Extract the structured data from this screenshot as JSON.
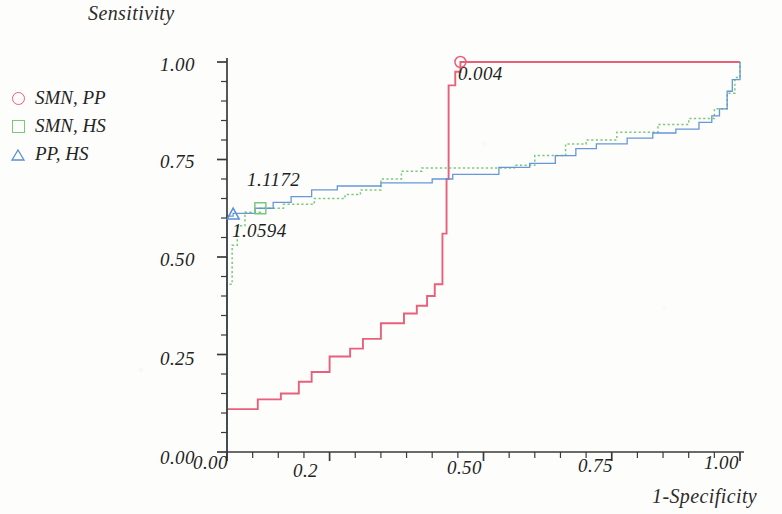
{
  "chart_data": {
    "type": "line",
    "title": "",
    "ylabel": "Sensitivity",
    "xlabel": "1-Specificity",
    "xlim": [
      0,
      1
    ],
    "ylim": [
      0,
      1
    ],
    "grid": false,
    "legend_position": "left",
    "x_ticks": [
      "0.00",
      "0.2",
      "0.50",
      "0.75",
      "1.00"
    ],
    "x_tick_values": [
      0,
      0.2,
      0.5,
      0.75,
      1.0
    ],
    "y_ticks": [
      "0.00",
      "0.25",
      "0.50",
      "0.75",
      "1.00"
    ],
    "y_tick_values": [
      0,
      0.25,
      0.5,
      0.75,
      1.0
    ],
    "legend": [
      {
        "label": "SMN, PP",
        "marker": "circle",
        "color": "#e8607a"
      },
      {
        "label": "SMN, HS",
        "marker": "square",
        "color": "#7ac97a"
      },
      {
        "label": "PP, HS",
        "marker": "triangle",
        "color": "#5a8fd6"
      }
    ],
    "annotations": [
      {
        "text": "0.004",
        "x": 0.455,
        "y": 1.0,
        "marker": "circle",
        "color": "#e8607a"
      },
      {
        "text": "1.1172",
        "x": 0.065,
        "y": 0.625,
        "marker": "square",
        "color": "#7ac97a"
      },
      {
        "text": "1.0594",
        "x": 0.012,
        "y": 0.61,
        "marker": "triangle",
        "color": "#5a8fd6"
      }
    ],
    "series": [
      {
        "name": "SMN, PP",
        "color": "#e8607a",
        "style": "solid",
        "points": [
          [
            0.0,
            0.11
          ],
          [
            0.06,
            0.11
          ],
          [
            0.06,
            0.135
          ],
          [
            0.105,
            0.135
          ],
          [
            0.105,
            0.15
          ],
          [
            0.14,
            0.15
          ],
          [
            0.14,
            0.18
          ],
          [
            0.165,
            0.18
          ],
          [
            0.165,
            0.205
          ],
          [
            0.2,
            0.205
          ],
          [
            0.2,
            0.245
          ],
          [
            0.24,
            0.245
          ],
          [
            0.24,
            0.265
          ],
          [
            0.265,
            0.265
          ],
          [
            0.265,
            0.29
          ],
          [
            0.3,
            0.29
          ],
          [
            0.3,
            0.33
          ],
          [
            0.345,
            0.33
          ],
          [
            0.345,
            0.355
          ],
          [
            0.37,
            0.355
          ],
          [
            0.37,
            0.375
          ],
          [
            0.39,
            0.375
          ],
          [
            0.39,
            0.4
          ],
          [
            0.405,
            0.4
          ],
          [
            0.405,
            0.43
          ],
          [
            0.42,
            0.43
          ],
          [
            0.42,
            0.56
          ],
          [
            0.428,
            0.56
          ],
          [
            0.428,
            0.7
          ],
          [
            0.432,
            0.7
          ],
          [
            0.432,
            0.94
          ],
          [
            0.445,
            0.94
          ],
          [
            0.445,
            0.975
          ],
          [
            0.455,
            0.975
          ],
          [
            0.455,
            1.0
          ],
          [
            1.0,
            1.0
          ]
        ]
      },
      {
        "name": "SMN, HS",
        "color": "#7ac97a",
        "style": "dotted",
        "points": [
          [
            0.0,
            0.0
          ],
          [
            0.0,
            0.43
          ],
          [
            0.01,
            0.43
          ],
          [
            0.01,
            0.53
          ],
          [
            0.02,
            0.53
          ],
          [
            0.02,
            0.58
          ],
          [
            0.035,
            0.58
          ],
          [
            0.035,
            0.615
          ],
          [
            0.065,
            0.615
          ],
          [
            0.065,
            0.625
          ],
          [
            0.11,
            0.625
          ],
          [
            0.11,
            0.635
          ],
          [
            0.17,
            0.635
          ],
          [
            0.17,
            0.65
          ],
          [
            0.23,
            0.65
          ],
          [
            0.23,
            0.66
          ],
          [
            0.26,
            0.66
          ],
          [
            0.26,
            0.672
          ],
          [
            0.3,
            0.672
          ],
          [
            0.3,
            0.7
          ],
          [
            0.34,
            0.7
          ],
          [
            0.34,
            0.72
          ],
          [
            0.38,
            0.72
          ],
          [
            0.38,
            0.728
          ],
          [
            0.56,
            0.728
          ],
          [
            0.56,
            0.735
          ],
          [
            0.6,
            0.735
          ],
          [
            0.6,
            0.76
          ],
          [
            0.66,
            0.76
          ],
          [
            0.66,
            0.79
          ],
          [
            0.7,
            0.79
          ],
          [
            0.7,
            0.8
          ],
          [
            0.76,
            0.8
          ],
          [
            0.76,
            0.82
          ],
          [
            0.84,
            0.82
          ],
          [
            0.84,
            0.84
          ],
          [
            0.9,
            0.84
          ],
          [
            0.9,
            0.855
          ],
          [
            0.95,
            0.855
          ],
          [
            0.95,
            0.88
          ],
          [
            0.975,
            0.88
          ],
          [
            0.975,
            0.92
          ],
          [
            0.99,
            0.92
          ],
          [
            0.99,
            0.96
          ],
          [
            1.0,
            0.96
          ],
          [
            1.0,
            1.0
          ]
        ]
      },
      {
        "name": "PP, HS",
        "color": "#5a8fd6",
        "style": "solid-thin",
        "points": [
          [
            0.0,
            0.0
          ],
          [
            0.0,
            0.605
          ],
          [
            0.012,
            0.605
          ],
          [
            0.012,
            0.612
          ],
          [
            0.055,
            0.612
          ],
          [
            0.055,
            0.625
          ],
          [
            0.09,
            0.625
          ],
          [
            0.09,
            0.64
          ],
          [
            0.125,
            0.64
          ],
          [
            0.125,
            0.655
          ],
          [
            0.165,
            0.655
          ],
          [
            0.165,
            0.672
          ],
          [
            0.215,
            0.672
          ],
          [
            0.215,
            0.682
          ],
          [
            0.3,
            0.682
          ],
          [
            0.3,
            0.69
          ],
          [
            0.4,
            0.69
          ],
          [
            0.4,
            0.7
          ],
          [
            0.44,
            0.7
          ],
          [
            0.44,
            0.712
          ],
          [
            0.53,
            0.712
          ],
          [
            0.53,
            0.73
          ],
          [
            0.59,
            0.73
          ],
          [
            0.59,
            0.74
          ],
          [
            0.64,
            0.74
          ],
          [
            0.64,
            0.76
          ],
          [
            0.68,
            0.76
          ],
          [
            0.68,
            0.778
          ],
          [
            0.72,
            0.778
          ],
          [
            0.72,
            0.79
          ],
          [
            0.78,
            0.79
          ],
          [
            0.78,
            0.805
          ],
          [
            0.83,
            0.805
          ],
          [
            0.83,
            0.818
          ],
          [
            0.875,
            0.818
          ],
          [
            0.875,
            0.828
          ],
          [
            0.92,
            0.828
          ],
          [
            0.92,
            0.845
          ],
          [
            0.945,
            0.845
          ],
          [
            0.945,
            0.862
          ],
          [
            0.96,
            0.862
          ],
          [
            0.96,
            0.88
          ],
          [
            0.975,
            0.88
          ],
          [
            0.975,
            0.925
          ],
          [
            0.985,
            0.925
          ],
          [
            0.985,
            0.955
          ],
          [
            1.0,
            0.955
          ],
          [
            1.0,
            1.0
          ]
        ]
      }
    ]
  },
  "axes": {
    "y_axis_title": "Sensitivity",
    "x_axis_title": "1-Specificity",
    "x_tick_labels": [
      "0.00",
      "0.2",
      "0.50",
      "0.75",
      "1.00"
    ],
    "y_tick_labels": [
      "1.00",
      "0.75",
      "0.50",
      "0.25",
      "0.00"
    ]
  },
  "legend": {
    "items": [
      {
        "label": "SMN, PP"
      },
      {
        "label": "SMN, HS"
      },
      {
        "label": "PP, HS"
      }
    ]
  },
  "annotations": {
    "red_cutoff": "0.004",
    "green_cutoff": "1.1172",
    "blue_cutoff": "1.0594"
  }
}
